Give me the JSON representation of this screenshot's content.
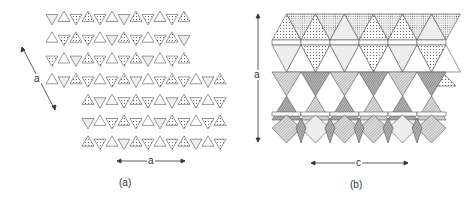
{
  "figure": {
    "panels": [
      {
        "id": "a",
        "caption": "(a)",
        "description": "Corner-sharing triangle (kagome-type) net of tetrahedra viewed along the stacking axis; alternate triangles stippled",
        "axis_labels": {
          "diagonal_arrow": "a",
          "horizontal_arrow": "a"
        }
      },
      {
        "id": "b",
        "caption": "(b)",
        "description": "Layered polyhedral framework of octahedra and tetrahedra with stippled and hatched shading",
        "axis_labels": {
          "vertical_arrow": "a",
          "horizontal_arrow": "c"
        }
      }
    ],
    "colors": {
      "line": "#555555",
      "stipple": "#666666",
      "hatch_dark": "#7a7a7a",
      "hatch_light": "#bdbdbd",
      "background": "#ffffff"
    }
  }
}
